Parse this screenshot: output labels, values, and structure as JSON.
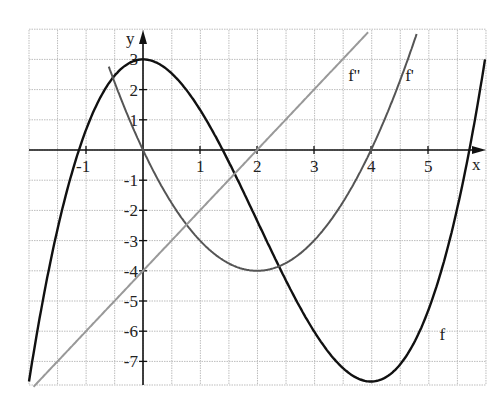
{
  "chart_data": {
    "type": "line",
    "title": "",
    "xlabel": "x",
    "ylabel": "y",
    "xlim": [
      -2,
      6
    ],
    "ylim": [
      -7.83,
      4
    ],
    "grid": true,
    "x_ticks": [
      -1,
      1,
      2,
      3,
      4,
      5
    ],
    "y_ticks": [
      3,
      2,
      1,
      -1,
      -2,
      -3,
      -4,
      -5,
      -6,
      -7
    ],
    "x_tick_labels": [
      "-1",
      "1",
      "2",
      "3",
      "4",
      "5"
    ],
    "y_tick_labels": [
      "3",
      "2",
      "1",
      "-1",
      "-2",
      "-3",
      "-4",
      "-5",
      "-6",
      "-7"
    ],
    "series": [
      {
        "name": "f",
        "formula": "x^3/3 - 2x^2 + 3",
        "color": "#111111",
        "x": [
          -2,
          -1.5,
          -1,
          -0.5,
          0,
          0.5,
          1,
          1.5,
          2,
          2.5,
          3,
          3.5,
          4,
          4.5,
          5,
          5.5,
          6
        ],
        "values": [
          -7.67,
          -2.63,
          0.67,
          2.46,
          3.0,
          2.54,
          1.33,
          -0.38,
          -2.33,
          -4.29,
          -6.0,
          -7.21,
          -7.67,
          -7.13,
          -5.33,
          -2.04,
          3.0
        ]
      },
      {
        "name": "f'",
        "formula": "x^2 - 4x",
        "color": "#555555",
        "x": [
          -0.6,
          0,
          0.5,
          1,
          1.5,
          2,
          2.5,
          3,
          3.5,
          4,
          4.5,
          4.8
        ],
        "values": [
          2.76,
          0,
          -1.75,
          -3,
          -3.75,
          -4,
          -3.75,
          -3,
          -1.75,
          0,
          2.25,
          3.84
        ]
      },
      {
        "name": "f''",
        "formula": "2x - 4",
        "color": "#999999",
        "x": [
          -2,
          -1,
          0,
          1,
          2,
          3,
          3.95
        ],
        "values": [
          -8,
          -6,
          -4,
          -2,
          0,
          2,
          3.9
        ]
      }
    ],
    "annotations": [
      {
        "text": "f''",
        "x": 3.6,
        "y": 2.3
      },
      {
        "text": "f'",
        "x": 4.6,
        "y": 2.3
      },
      {
        "text": "f",
        "x": 5.2,
        "y": -6.3
      }
    ]
  }
}
